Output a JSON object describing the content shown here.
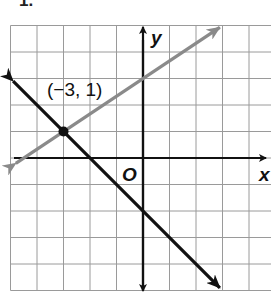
{
  "problem_number": "1.",
  "graph": {
    "x_axis_label": "x",
    "y_axis_label": "y",
    "origin_label": "O",
    "x_range": [
      -5,
      5
    ],
    "y_range": [
      -5,
      5
    ],
    "grid": true,
    "point": {
      "x": -3,
      "y": 1,
      "label": "(−3, 1)"
    },
    "lines": [
      {
        "name": "gray-line",
        "color": "#8a8a8a",
        "slope": 0.6667,
        "intercept": 3,
        "from": [
          -4.8,
          -0.2
        ],
        "to": [
          2.9,
          4.93
        ]
      },
      {
        "name": "black-line",
        "color": "#111111",
        "slope": -1,
        "intercept": -2,
        "from": [
          -4.9,
          2.9
        ],
        "to": [
          2.9,
          -4.9
        ]
      }
    ]
  }
}
